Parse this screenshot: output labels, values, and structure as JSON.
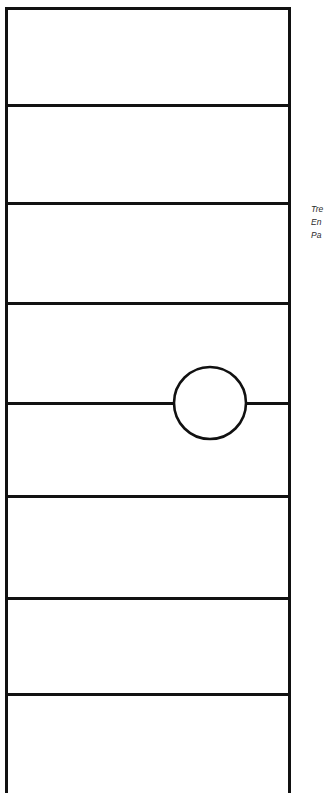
{
  "figure": {
    "background_color": "#ffffff",
    "stroke_color": "#111111",
    "stroke_width_px": 3,
    "canvas": {
      "width": 330,
      "height": 793
    },
    "outline": {
      "name": "outer-rectangle",
      "x": 6,
      "y": 8,
      "width": 283,
      "height": 785,
      "note": "bottom edge runs past the lower image boundary (clipped)"
    },
    "divider_lines": [
      {
        "id": "divider-1",
        "y": 105,
        "x_start": 6,
        "x_end": 289,
        "interrupted_by_circle": false
      },
      {
        "id": "divider-2",
        "y": 203,
        "x_start": 6,
        "x_end": 289,
        "interrupted_by_circle": false
      },
      {
        "id": "divider-3",
        "y": 303,
        "x_start": 6,
        "x_end": 289,
        "interrupted_by_circle": false
      },
      {
        "id": "divider-4",
        "y": 403,
        "x_start": 6,
        "x_end": 289,
        "interrupted_by_circle": true
      },
      {
        "id": "divider-5",
        "y": 497,
        "x_start": 6,
        "x_end": 289,
        "interrupted_by_circle": false
      },
      {
        "id": "divider-6",
        "y": 598,
        "x_start": 6,
        "x_end": 289,
        "interrupted_by_circle": false
      },
      {
        "id": "divider-7",
        "y": 694,
        "x_start": 6,
        "x_end": 289,
        "interrupted_by_circle": false
      }
    ],
    "bands": [
      {
        "id": "band-1",
        "top": 8,
        "bottom": 105
      },
      {
        "id": "band-2",
        "top": 105,
        "bottom": 203
      },
      {
        "id": "band-3",
        "top": 203,
        "bottom": 303
      },
      {
        "id": "band-4",
        "top": 303,
        "bottom": 403
      },
      {
        "id": "band-5",
        "top": 403,
        "bottom": 497
      },
      {
        "id": "band-6",
        "top": 497,
        "bottom": 598
      },
      {
        "id": "band-7",
        "top": 598,
        "bottom": 694
      },
      {
        "id": "band-8",
        "top": 694,
        "bottom": 793
      }
    ],
    "circle": {
      "id": "inscribed-circle",
      "center_x": 210,
      "center_y": 403,
      "radius": 36,
      "fill": "none",
      "note": "straddles divider-4; the divider line stops at the circle's left and right edges"
    }
  },
  "caption": {
    "clipped": true,
    "lines": [
      "Tre",
      "En",
      "Pa"
    ]
  }
}
